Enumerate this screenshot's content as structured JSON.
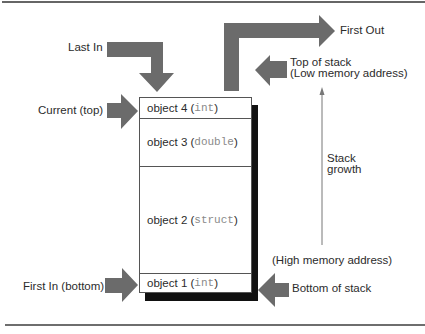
{
  "figure": {
    "arrow_color": "#6b6b6b",
    "shadow_color": "#111111"
  },
  "labels": {
    "last_in": "Last In",
    "first_out": "First Out",
    "current_top": "Current (top)",
    "first_in_bottom": "First In (bottom)",
    "top_of_stack": "Top of stack",
    "low_memory": "(Low memory address)",
    "stack_growth_1": "Stack",
    "stack_growth_2": "growth",
    "high_memory": "(High memory address)",
    "bottom_of_stack": "Bottom of stack"
  },
  "stack": {
    "items": [
      {
        "name": "object 4",
        "type": "int"
      },
      {
        "name": "object 3",
        "type": "double"
      },
      {
        "name": "object 2",
        "type": "struct"
      },
      {
        "name": "object 1",
        "type": "int"
      }
    ]
  }
}
